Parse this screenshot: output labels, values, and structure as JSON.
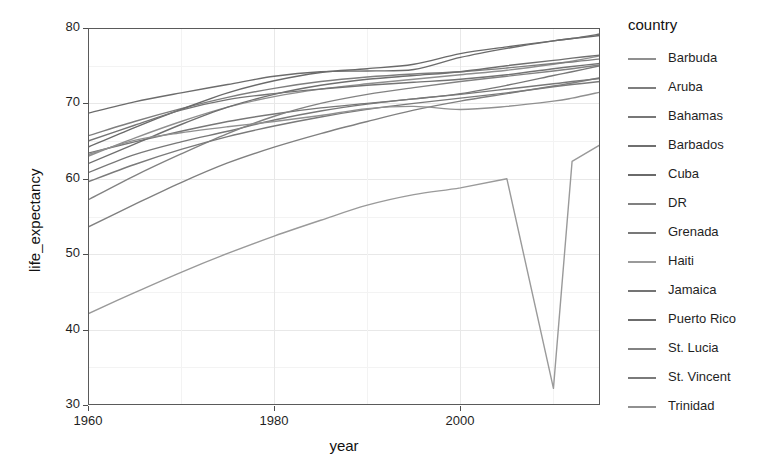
{
  "chart_data": {
    "type": "line",
    "title": "",
    "xlabel": "year",
    "ylabel": "life_expectancy",
    "legend_title": "country",
    "legend_position": "right",
    "grid": true,
    "xlim": [
      1960,
      2015
    ],
    "ylim": [
      30,
      80
    ],
    "xticks": [
      1960,
      1980,
      2000
    ],
    "xtick_labels": [
      "1960",
      "1980",
      "2000"
    ],
    "yticks": [
      30,
      40,
      50,
      60,
      70,
      80
    ],
    "ytick_labels": [
      "30",
      "40",
      "50",
      "60",
      "70",
      "80"
    ],
    "x": [
      1960,
      1965,
      1970,
      1975,
      1980,
      1985,
      1990,
      1995,
      2000,
      2005,
      2010,
      2012,
      2015
    ],
    "series": [
      {
        "name": "Barbuda",
        "color": "#8f8f8f",
        "values": [
          63.0,
          65.4,
          67.6,
          69.5,
          70.9,
          71.9,
          72.6,
          73.2,
          73.8,
          74.4,
          75.2,
          75.6,
          76.3
        ]
      },
      {
        "name": "Aruba",
        "color": "#7e7e7e",
        "values": [
          65.7,
          67.6,
          69.3,
          70.8,
          72.0,
          72.9,
          73.5,
          73.9,
          74.2,
          74.7,
          75.3,
          75.5,
          75.9
        ]
      },
      {
        "name": "Bahamas",
        "color": "#777777",
        "values": [
          63.4,
          64.9,
          66.3,
          67.6,
          68.6,
          69.4,
          70.0,
          70.6,
          71.3,
          72.4,
          73.7,
          74.2,
          75.0
        ]
      },
      {
        "name": "Barbados",
        "color": "#6f6f6f",
        "values": [
          62.0,
          64.6,
          67.2,
          69.5,
          71.2,
          72.4,
          73.2,
          73.7,
          74.2,
          75.0,
          75.7,
          76.0,
          76.4
        ]
      },
      {
        "name": "Cuba",
        "color": "#6a6a6a",
        "values": [
          64.2,
          66.8,
          69.2,
          71.4,
          73.0,
          74.1,
          74.6,
          75.2,
          76.6,
          77.5,
          78.3,
          78.6,
          79.0
        ]
      },
      {
        "name": "DR",
        "color": "#808080",
        "values": [
          53.6,
          56.6,
          59.5,
          62.1,
          64.2,
          66.0,
          67.6,
          69.1,
          70.3,
          71.3,
          72.3,
          72.7,
          73.4
        ]
      },
      {
        "name": "Grenada",
        "color": "#787878",
        "values": [
          60.8,
          63.2,
          64.9,
          66.3,
          67.8,
          69.0,
          69.9,
          70.6,
          71.2,
          71.9,
          72.6,
          72.9,
          73.3
        ]
      },
      {
        "name": "Haiti",
        "color": "#9a9a9a",
        "values": [
          42.1,
          44.9,
          47.6,
          50.1,
          52.4,
          54.5,
          56.5,
          57.9,
          58.8,
          60.0,
          32.2,
          62.3,
          64.5
        ]
      },
      {
        "name": "Jamaica",
        "color": "#747474",
        "values": [
          65.0,
          67.1,
          69.1,
          70.5,
          71.3,
          71.9,
          72.4,
          72.8,
          73.2,
          73.8,
          74.6,
          74.9,
          75.3
        ]
      },
      {
        "name": "Puerto Rico",
        "color": "#6c6c6c",
        "values": [
          68.7,
          70.2,
          71.4,
          72.5,
          73.6,
          74.2,
          74.3,
          74.5,
          76.1,
          77.3,
          78.3,
          78.6,
          79.2
        ]
      },
      {
        "name": "St. Lucia",
        "color": "#828282",
        "values": [
          57.2,
          60.4,
          63.3,
          66.0,
          68.3,
          70.0,
          71.2,
          72.1,
          72.9,
          73.6,
          74.3,
          74.6,
          75.1
        ]
      },
      {
        "name": "St. Vincent",
        "color": "#7a7a7a",
        "values": [
          59.6,
          61.9,
          63.9,
          65.6,
          67.0,
          68.2,
          69.2,
          70.0,
          70.7,
          71.4,
          72.2,
          72.5,
          72.9
        ]
      },
      {
        "name": "Trinidad",
        "color": "#909090",
        "values": [
          63.2,
          65.1,
          66.1,
          66.9,
          67.6,
          68.4,
          69.3,
          69.6,
          69.2,
          69.6,
          70.3,
          70.7,
          71.5
        ]
      }
    ]
  },
  "axes": {
    "x_title": "year",
    "y_title": "life_expectancy"
  },
  "legend": {
    "title": "country",
    "items": [
      {
        "label": "Barbuda"
      },
      {
        "label": "Aruba"
      },
      {
        "label": "Bahamas"
      },
      {
        "label": "Barbados"
      },
      {
        "label": "Cuba"
      },
      {
        "label": "DR"
      },
      {
        "label": "Grenada"
      },
      {
        "label": "Haiti"
      },
      {
        "label": "Jamaica"
      },
      {
        "label": "Puerto Rico"
      },
      {
        "label": "St. Lucia"
      },
      {
        "label": "St. Vincent"
      },
      {
        "label": "Trinidad"
      }
    ]
  },
  "style": {
    "panel_background": "#ffffff",
    "panel_border": "#5a5a5a",
    "grid_major": "#e8e8e8",
    "grid_minor": "#f3f3f3",
    "text": "#1f1f1f"
  }
}
